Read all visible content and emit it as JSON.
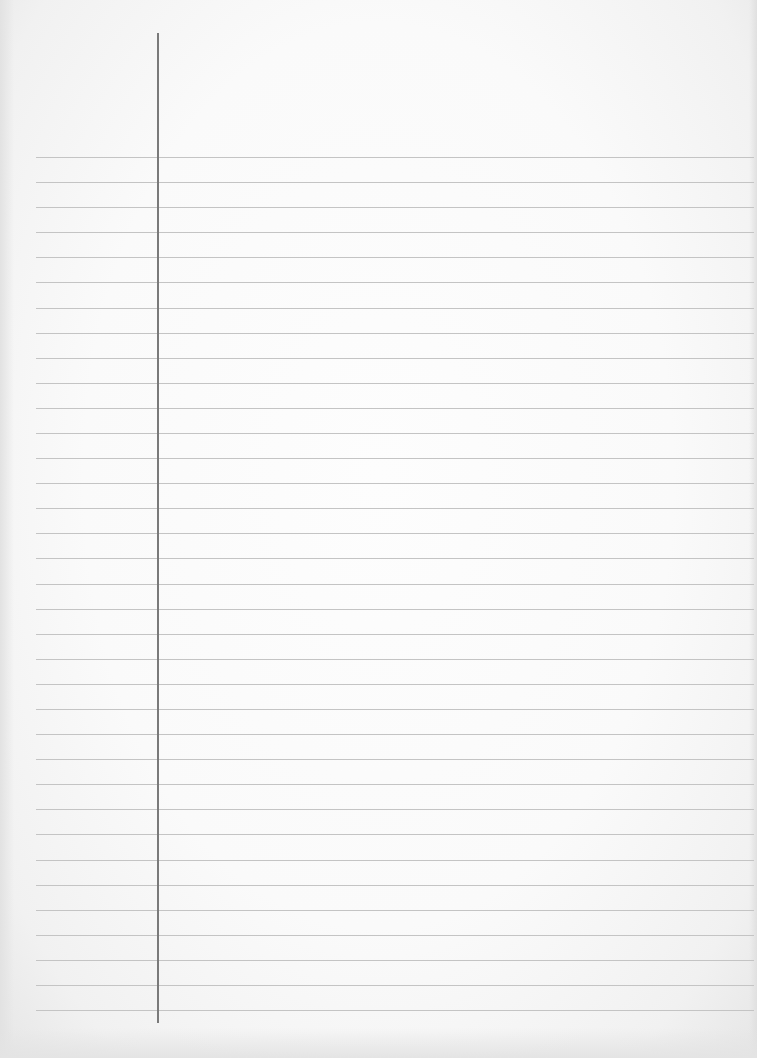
{
  "paper": {
    "type": "lined-paper",
    "background_color": "#fafafa",
    "rule_color": "#c4c4c4",
    "margin_line_color": "#7a7a7a",
    "rule_count": 35,
    "first_rule_y": 157,
    "rule_spacing": 25.09,
    "rule_left_x": 36,
    "rule_right_x": 754,
    "margin_line_x": 157,
    "margin_line_top": 33,
    "margin_line_bottom": 1023
  },
  "content": {
    "text": ""
  }
}
